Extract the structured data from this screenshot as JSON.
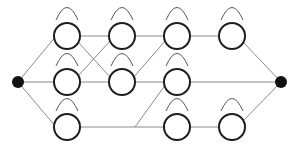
{
  "diagram": {
    "type": "directed-graph",
    "colors": {
      "edge": "#8a8a8a",
      "node_stroke": "#1e1e1e",
      "terminal": "#111111",
      "loop": "#555555"
    },
    "node_radius": 13,
    "source": {
      "id": "source",
      "x": 18,
      "y": 82
    },
    "sink": {
      "id": "sink",
      "x": 281,
      "y": 82
    },
    "nodes": [
      {
        "id": "n11",
        "x": 67,
        "y": 36
      },
      {
        "id": "n12",
        "x": 67,
        "y": 82
      },
      {
        "id": "n13",
        "x": 67,
        "y": 127
      },
      {
        "id": "n21",
        "x": 122,
        "y": 36
      },
      {
        "id": "n22",
        "x": 122,
        "y": 82
      },
      {
        "id": "n31",
        "x": 177,
        "y": 36
      },
      {
        "id": "n32",
        "x": 177,
        "y": 82
      },
      {
        "id": "n33",
        "x": 177,
        "y": 127
      },
      {
        "id": "n41",
        "x": 232,
        "y": 36
      },
      {
        "id": "n43",
        "x": 232,
        "y": 127
      }
    ],
    "edges": [
      {
        "from": [
          18,
          82
        ],
        "to": [
          56,
          36
        ]
      },
      {
        "from": [
          18,
          82
        ],
        "to": [
          54,
          82
        ]
      },
      {
        "from": [
          18,
          82
        ],
        "to": [
          56,
          127
        ]
      },
      {
        "from": [
          80,
          36
        ],
        "to": [
          109,
          36
        ]
      },
      {
        "from": [
          78,
          42
        ],
        "to": [
          111,
          78
        ]
      },
      {
        "from": [
          78,
          76
        ],
        "to": [
          111,
          40
        ]
      },
      {
        "from": [
          80,
          82
        ],
        "to": [
          109,
          82
        ]
      },
      {
        "from": [
          80,
          127
        ],
        "to": [
          164,
          127
        ]
      },
      {
        "from": [
          135,
          127
        ],
        "to": [
          166,
          84
        ]
      },
      {
        "from": [
          135,
          36
        ],
        "to": [
          164,
          36
        ]
      },
      {
        "from": [
          133,
          78
        ],
        "to": [
          166,
          40
        ]
      },
      {
        "from": [
          135,
          82
        ],
        "to": [
          164,
          82
        ]
      },
      {
        "from": [
          190,
          36
        ],
        "to": [
          219,
          36
        ]
      },
      {
        "from": [
          190,
          82
        ],
        "to": [
          281,
          82
        ]
      },
      {
        "from": [
          190,
          127
        ],
        "to": [
          219,
          127
        ]
      },
      {
        "from": [
          243,
          42
        ],
        "to": [
          281,
          82
        ]
      },
      {
        "from": [
          243,
          121
        ],
        "to": [
          281,
          82
        ]
      }
    ]
  }
}
